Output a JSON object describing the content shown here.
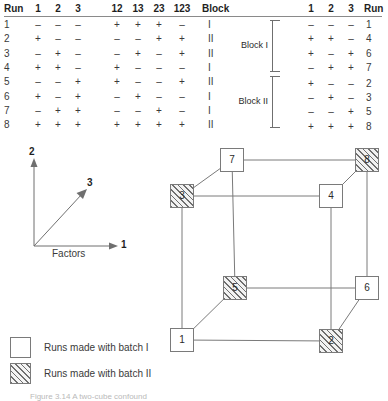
{
  "figure": {
    "caption": "Figure 3.14  A two-cube confound"
  },
  "design_table": {
    "headers": {
      "run": "Run",
      "factors": [
        "1",
        "2",
        "3"
      ],
      "interactions": [
        "12",
        "13",
        "23",
        "123"
      ],
      "block": "Block"
    },
    "rows": [
      {
        "run": "1",
        "f": [
          "–",
          "–",
          "–"
        ],
        "i": [
          "+",
          "+",
          "+",
          "–"
        ],
        "block": "I"
      },
      {
        "run": "2",
        "f": [
          "+",
          "–",
          "–"
        ],
        "i": [
          "–",
          "–",
          "+",
          "+"
        ],
        "block": "II"
      },
      {
        "run": "3",
        "f": [
          "–",
          "+",
          "–"
        ],
        "i": [
          "–",
          "+",
          "–",
          "+"
        ],
        "block": "II"
      },
      {
        "run": "4",
        "f": [
          "+",
          "+",
          "–"
        ],
        "i": [
          "+",
          "–",
          "–",
          "–"
        ],
        "block": "I"
      },
      {
        "run": "5",
        "f": [
          "–",
          "–",
          "+"
        ],
        "i": [
          "+",
          "–",
          "–",
          "+"
        ],
        "block": "II"
      },
      {
        "run": "6",
        "f": [
          "+",
          "–",
          "+"
        ],
        "i": [
          "–",
          "+",
          "–",
          "–"
        ],
        "block": "I"
      },
      {
        "run": "7",
        "f": [
          "–",
          "+",
          "+"
        ],
        "i": [
          "–",
          "–",
          "+",
          "–"
        ],
        "block": "I"
      },
      {
        "run": "8",
        "f": [
          "+",
          "+",
          "+"
        ],
        "i": [
          "+",
          "+",
          "+",
          "+"
        ],
        "block": "II"
      }
    ]
  },
  "blocked_table": {
    "headers": {
      "factors": [
        "1",
        "2",
        "3"
      ],
      "run": "Run"
    },
    "blocks": [
      {
        "label": "Block I",
        "rows": [
          {
            "f": [
              "–",
              "–",
              "–"
            ],
            "run": "1"
          },
          {
            "f": [
              "+",
              "+",
              "–"
            ],
            "run": "4"
          },
          {
            "f": [
              "+",
              "–",
              "+"
            ],
            "run": "6"
          },
          {
            "f": [
              "–",
              "+",
              "+"
            ],
            "run": "7"
          }
        ]
      },
      {
        "label": "Block II",
        "rows": [
          {
            "f": [
              "+",
              "–",
              "–"
            ],
            "run": "2"
          },
          {
            "f": [
              "–",
              "+",
              "–"
            ],
            "run": "3"
          },
          {
            "f": [
              "–",
              "–",
              "+"
            ],
            "run": "5"
          },
          {
            "f": [
              "+",
              "+",
              "+"
            ],
            "run": "8"
          }
        ]
      }
    ]
  },
  "axes_diagram": {
    "axis_1_label": "1",
    "axis_2_label": "2",
    "axis_3_label": "3",
    "caption": "Factors"
  },
  "cube": {
    "nodes": [
      {
        "label": "1",
        "batch": "I",
        "x": 22,
        "y": 200
      },
      {
        "label": "2",
        "batch": "II",
        "x": 171,
        "y": 201
      },
      {
        "label": "3",
        "batch": "II",
        "x": 22,
        "y": 56
      },
      {
        "label": "4",
        "batch": "I",
        "x": 171,
        "y": 56
      },
      {
        "label": "5",
        "batch": "II",
        "x": 75,
        "y": 148
      },
      {
        "label": "6",
        "batch": "I",
        "x": 207,
        "y": 148
      },
      {
        "label": "7",
        "batch": "I",
        "x": 72,
        "y": 20
      },
      {
        "label": "8",
        "batch": "II",
        "x": 207,
        "y": 20
      }
    ]
  },
  "legend": {
    "items": [
      {
        "swatch": "open",
        "text": "Runs made with batch  I"
      },
      {
        "swatch": "hatched",
        "text": "Runs made with batch II"
      }
    ]
  },
  "colors": {
    "line": "#7a7a7a",
    "rule": "#8a8a8a",
    "text": "#2b2b2b",
    "hatch": "#6f6f6f"
  }
}
